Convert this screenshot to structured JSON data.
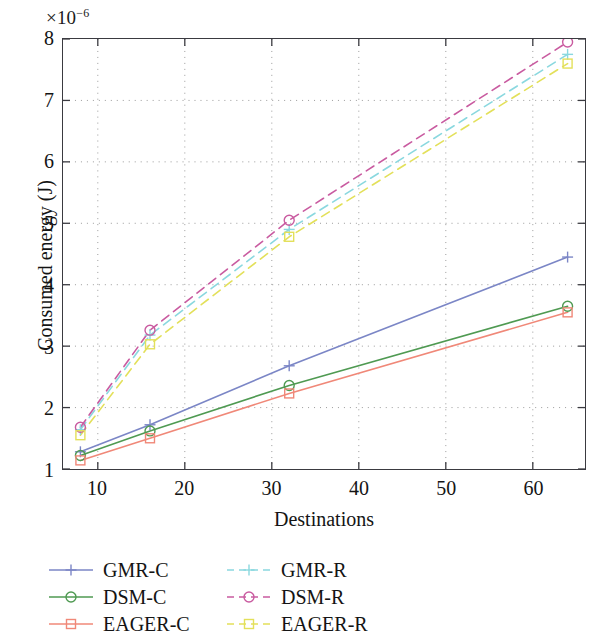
{
  "chart_data": {
    "type": "line",
    "title": "",
    "xlabel": "Destinations",
    "ylabel": "Consumed energy (J)",
    "y_multiplier": "×10",
    "y_multiplier_exponent": "−6",
    "x": [
      8,
      16,
      32,
      64
    ],
    "xlim": [
      6,
      66
    ],
    "ylim": [
      1,
      8
    ],
    "xticks": [
      10,
      20,
      30,
      40,
      50,
      60
    ],
    "yticks": [
      1,
      2,
      3,
      4,
      5,
      6,
      7,
      8
    ],
    "grid": true,
    "legend_position": "below",
    "series": [
      {
        "name": "GMR-C",
        "values": [
          1.28,
          1.72,
          2.68,
          4.45
        ],
        "color": "#7b86c6",
        "style": "solid",
        "marker": "plus"
      },
      {
        "name": "DSM-C",
        "values": [
          1.22,
          1.62,
          2.36,
          3.65
        ],
        "color": "#4f9a52",
        "style": "solid",
        "marker": "circle"
      },
      {
        "name": "EAGER-C",
        "values": [
          1.14,
          1.5,
          2.23,
          3.55
        ],
        "color": "#f08878",
        "style": "solid",
        "marker": "square"
      },
      {
        "name": "GMR-R",
        "values": [
          1.64,
          3.18,
          4.9,
          7.75
        ],
        "color": "#8ad8df",
        "style": "dashed",
        "marker": "plus"
      },
      {
        "name": "DSM-R",
        "values": [
          1.68,
          3.26,
          5.05,
          7.95
        ],
        "color": "#c95ba0",
        "style": "dashed",
        "marker": "circle"
      },
      {
        "name": "EAGER-R",
        "values": [
          1.55,
          3.03,
          4.78,
          7.6
        ],
        "color": "#e3e05a",
        "style": "dashed",
        "marker": "square"
      }
    ]
  },
  "axis": {
    "multiplier_base": "×10",
    "multiplier_exp": "−6",
    "xlabel": "Destinations",
    "ylabel": "Consumed energy (J)",
    "xticks": [
      "10",
      "20",
      "30",
      "40",
      "50",
      "60"
    ],
    "yticks": [
      "8",
      "7",
      "6",
      "5",
      "4",
      "3",
      "2",
      "1"
    ]
  },
  "legend": {
    "entries": [
      {
        "label": "GMR-C"
      },
      {
        "label": "GMR-R"
      },
      {
        "label": "DSM-C"
      },
      {
        "label": "DSM-R"
      },
      {
        "label": "EAGER-C"
      },
      {
        "label": "EAGER-R"
      }
    ]
  },
  "colors": {
    "frame": "#3a3a40",
    "grid": "#9a9a9a",
    "text": "#141414",
    "background": "#ffffff"
  }
}
